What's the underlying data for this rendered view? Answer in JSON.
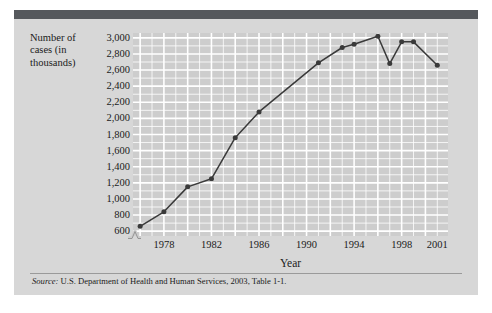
{
  "figure": {
    "header_bar_color": "#55585c",
    "panel_bg": "#d7d7d7",
    "plot_bg": "#cdcdcd",
    "grid_color": "#ffffff",
    "series_color": "#3a3a3a",
    "source_label": "Source:",
    "source_text": " U.S. Department of Health and Human Services, 2003, Table 1-1."
  },
  "chart_data": {
    "type": "line",
    "title": "",
    "xlabel": "Year",
    "ylabel": "Number of cases (in thousands)",
    "ylabel_lines": [
      "Number of",
      "cases (in",
      "thousands)"
    ],
    "xlim": [
      1975.4,
      2001.9
    ],
    "ylim": [
      540,
      3060
    ],
    "yticks": [
      600,
      800,
      1000,
      1200,
      1400,
      1600,
      1800,
      2000,
      2200,
      2400,
      2600,
      2800,
      3000
    ],
    "ytick_labels": [
      "600",
      "800",
      "1,000",
      "1,200",
      "1,400",
      "1,600",
      "1,800",
      "2,000",
      "2,200",
      "2,400",
      "2,600",
      "2,800",
      "3,000"
    ],
    "xticks": [
      1978,
      1982,
      1986,
      1990,
      1994,
      1998,
      2001
    ],
    "xtick_labels": [
      "1978",
      "1982",
      "1986",
      "1990",
      "1994",
      "1998",
      "2001"
    ],
    "grid": true,
    "minor_grid": true,
    "legend": "none",
    "axis_break": true,
    "x": [
      1976,
      1978,
      1980,
      1982,
      1984,
      1986,
      1991,
      1993,
      1994,
      1996,
      1997,
      1998,
      1999,
      2001
    ],
    "values": [
      660,
      840,
      1150,
      1250,
      1760,
      2080,
      2690,
      2880,
      2920,
      3020,
      2680,
      2950,
      2950,
      2660
    ],
    "series": [
      {
        "name": "Number of cases",
        "points": [
          {
            "x": 1976,
            "y": 660
          },
          {
            "x": 1978,
            "y": 840
          },
          {
            "x": 1980,
            "y": 1150
          },
          {
            "x": 1982,
            "y": 1250
          },
          {
            "x": 1984,
            "y": 1760
          },
          {
            "x": 1986,
            "y": 2080
          },
          {
            "x": 1991,
            "y": 2690
          },
          {
            "x": 1993,
            "y": 2880
          },
          {
            "x": 1994,
            "y": 2920
          },
          {
            "x": 1996,
            "y": 3020
          },
          {
            "x": 1997,
            "y": 2680
          },
          {
            "x": 1998,
            "y": 2950
          },
          {
            "x": 1999,
            "y": 2950
          },
          {
            "x": 2001,
            "y": 2660
          }
        ]
      }
    ]
  }
}
